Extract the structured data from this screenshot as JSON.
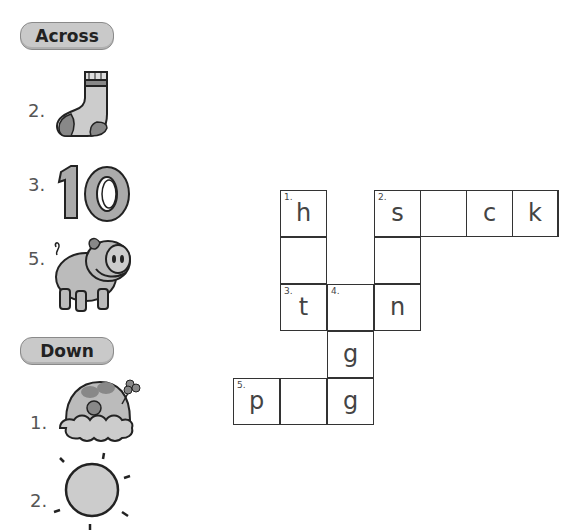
{
  "across": {
    "heading": "Across",
    "clues": [
      {
        "number": "2.",
        "picture": "sock-icon"
      },
      {
        "number": "3.",
        "picture": "number-ten-icon"
      },
      {
        "number": "5.",
        "picture": "pig-icon"
      }
    ]
  },
  "down": {
    "heading": "Down",
    "clues": [
      {
        "number": "1.",
        "picture": "hat-icon"
      },
      {
        "number": "2.",
        "picture": "sun-icon"
      }
    ]
  },
  "crossword": {
    "cells": [
      {
        "row": 0,
        "col": 1,
        "number": "1.",
        "letter": "h"
      },
      {
        "row": 0,
        "col": 3,
        "number": "2.",
        "letter": "s"
      },
      {
        "row": 0,
        "col": 4,
        "number": "",
        "letter": ""
      },
      {
        "row": 0,
        "col": 5,
        "number": "",
        "letter": "c"
      },
      {
        "row": 0,
        "col": 6,
        "number": "",
        "letter": "k"
      },
      {
        "row": 1,
        "col": 1,
        "number": "",
        "letter": ""
      },
      {
        "row": 1,
        "col": 3,
        "number": "",
        "letter": ""
      },
      {
        "row": 2,
        "col": 1,
        "number": "3.",
        "letter": "t"
      },
      {
        "row": 2,
        "col": 2,
        "number": "4.",
        "letter": ""
      },
      {
        "row": 2,
        "col": 3,
        "number": "",
        "letter": "n"
      },
      {
        "row": 3,
        "col": 2,
        "number": "",
        "letter": "g"
      },
      {
        "row": 4,
        "col": 0,
        "number": "5.",
        "letter": "p"
      },
      {
        "row": 4,
        "col": 1,
        "number": "",
        "letter": ""
      },
      {
        "row": 4,
        "col": 2,
        "number": "",
        "letter": "g"
      }
    ]
  }
}
